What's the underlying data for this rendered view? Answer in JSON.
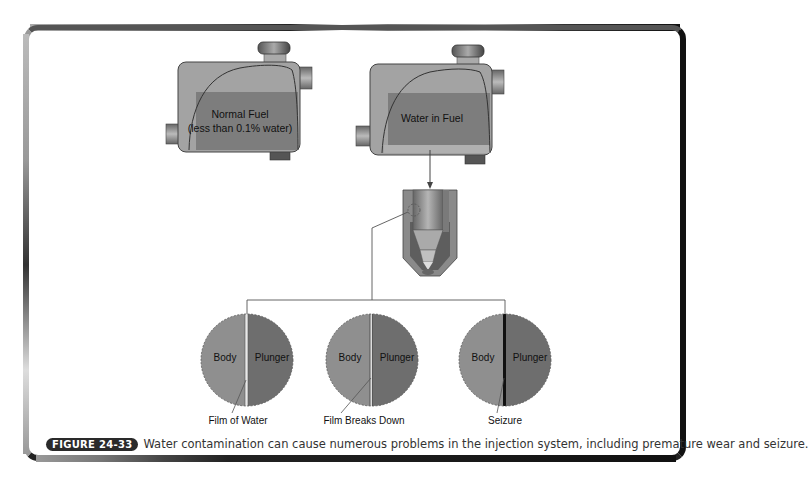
{
  "figure": {
    "number_badge": "FIGURE 24-33",
    "caption": "Water contamination can cause numerous problems in the injection system, including premature wear and seizure."
  },
  "filters": [
    {
      "label_line1": "Normal Fuel",
      "label_line2": "(less than 0.1% water)"
    },
    {
      "label_line1": "Water in Fuel"
    }
  ],
  "circles": [
    {
      "left_label": "Body",
      "right_label": "Plunger",
      "caption": "Film of Water"
    },
    {
      "left_label": "Body",
      "right_label": "Plunger",
      "caption": "Film Breaks Down"
    },
    {
      "left_label": "Body",
      "right_label": "Plunger",
      "caption": "Seizure"
    }
  ],
  "colors": {
    "body_fill": "#8f8f8f",
    "plunger_fill": "#6e6e6e",
    "fuel_fill": "#7d7d7d",
    "badge_bg": "#2a2a2a"
  }
}
